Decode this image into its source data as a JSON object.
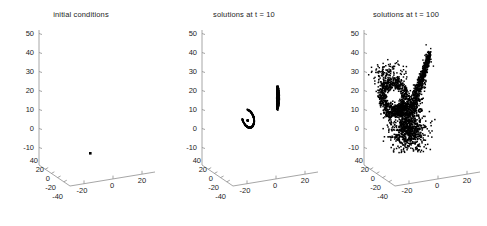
{
  "figure": {
    "background_color": "#ffffff",
    "axis_color": "#8f8f8f",
    "marker_color": "#000000",
    "panel_count": 3
  },
  "chart_data": [
    {
      "type": "scatter",
      "projection": "3d",
      "title": "initial conditions",
      "xlabel": "",
      "ylabel": "",
      "zlabel": "",
      "xlim": [
        -40,
        30
      ],
      "ylim": [
        -50,
        50
      ],
      "zlim": [
        -10,
        50
      ],
      "xticks": [
        -20,
        0,
        20
      ],
      "xticklabels": [
        "-20",
        "0",
        "20"
      ],
      "yticks": [
        40,
        20,
        0,
        -20,
        -40
      ],
      "yticklabels": [
        "40",
        "20",
        "0",
        "-20",
        "-40"
      ],
      "zticks": [
        -10,
        0,
        10,
        20,
        30,
        40,
        50
      ],
      "zticklabels": [
        "-10",
        "0",
        "10",
        "20",
        "30",
        "40",
        "50"
      ],
      "grid": false,
      "legend": null,
      "n_points": 1,
      "points": [
        {
          "x": -5.0,
          "y": -3.0,
          "z": -8.0
        }
      ]
    },
    {
      "type": "scatter",
      "projection": "3d",
      "title": "solutions at t = 10",
      "xlabel": "",
      "ylabel": "",
      "zlabel": "",
      "xlim": [
        -40,
        30
      ],
      "ylim": [
        -50,
        50
      ],
      "zlim": [
        -10,
        50
      ],
      "xticks": [
        -20,
        0,
        20
      ],
      "xticklabels": [
        "-20",
        "0",
        "20"
      ],
      "yticks": [
        40,
        20,
        0,
        -20,
        -40
      ],
      "yticklabels": [
        "40",
        "20",
        "0",
        "-20",
        "-40"
      ],
      "zticks": [
        -10,
        0,
        10,
        20,
        30,
        40,
        50
      ],
      "zticklabels": [
        "-10",
        "0",
        "10",
        "20",
        "30",
        "40",
        "50"
      ],
      "grid": false,
      "legend": null,
      "n_points": 900,
      "clusters": [
        {
          "name": "left-arc",
          "center_z": 14,
          "extent_z": [
            9,
            19
          ],
          "shape": "open-ring"
        },
        {
          "name": "right-streak",
          "center_z": 21,
          "extent_z": [
            17,
            25
          ],
          "shape": "thin-streak"
        }
      ]
    },
    {
      "type": "scatter",
      "projection": "3d",
      "title": "solutions at t = 100",
      "xlabel": "",
      "ylabel": "",
      "zlabel": "",
      "xlim": [
        -40,
        30
      ],
      "ylim": [
        -50,
        50
      ],
      "zlim": [
        -10,
        50
      ],
      "xticks": [
        -20,
        0,
        20
      ],
      "xticklabels": [
        "-20",
        "0",
        "20"
      ],
      "yticks": [
        40,
        20,
        0,
        -20,
        -40
      ],
      "yticklabels": [
        "40",
        "20",
        "0",
        "-20",
        "-40"
      ],
      "zticks": [
        -10,
        0,
        10,
        20,
        30,
        40,
        50
      ],
      "zticklabels": [
        "-10",
        "0",
        "10",
        "20",
        "30",
        "40",
        "50"
      ],
      "grid": false,
      "legend": null,
      "n_points": 2000,
      "clusters": [
        {
          "name": "left-lobe",
          "center_z": 18,
          "extent_z": [
            -2,
            31
          ],
          "shape": "butterfly-wing"
        },
        {
          "name": "right-plume",
          "center_z": 14,
          "extent_z": [
            -8,
            40
          ],
          "shape": "narrow-plume"
        },
        {
          "name": "lower-body",
          "center_z": 3,
          "extent_z": [
            -9,
            12
          ],
          "shape": "dense-blob"
        }
      ]
    }
  ]
}
